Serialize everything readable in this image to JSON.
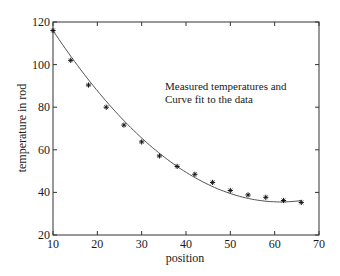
{
  "chart_data": {
    "type": "scatter",
    "title": "",
    "xlabel": "position",
    "ylabel": "temperature in rod",
    "xlim": [
      10,
      70
    ],
    "ylim": [
      20,
      120
    ],
    "xticks": [
      10,
      20,
      30,
      40,
      50,
      60,
      70
    ],
    "yticks": [
      20,
      40,
      60,
      80,
      100,
      120
    ],
    "grid": false,
    "box": true,
    "annotation": [
      "Measured temperatures and",
      "Curve fit to the data"
    ],
    "series": [
      {
        "name": "Measured temperatures",
        "type": "scatter",
        "marker": "*",
        "x": [
          10,
          14,
          18,
          22,
          26,
          30,
          34,
          38,
          42,
          46,
          50,
          54,
          58,
          62,
          66
        ],
        "values": [
          116,
          102,
          90.4,
          80,
          71.6,
          63.7,
          57.1,
          52.2,
          48.5,
          44.7,
          40.9,
          38.8,
          37.7,
          36.2,
          35.3
        ]
      },
      {
        "name": "Curve fit to the data",
        "type": "line",
        "model": "quadratic",
        "coefficients": {
          "a": 150.37,
          "b": -3.742,
          "c": 0.03048
        },
        "x_range": [
          10,
          66
        ]
      }
    ]
  },
  "colors": {
    "axis": "#333333",
    "curve": "#555555",
    "marker": "#111111",
    "text": "#1a1a1a",
    "background": "#ffffff"
  }
}
